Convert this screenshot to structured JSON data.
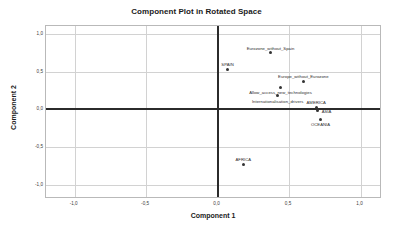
{
  "chart_data": {
    "type": "scatter",
    "title": "Component Plot in Rotated Space",
    "xlabel": "Component 1",
    "ylabel": "Component 2",
    "xlim": [
      -1.2,
      1.15
    ],
    "ylim": [
      -1.18,
      1.1
    ],
    "grid": true,
    "legend": "none",
    "decimal_separator": ",",
    "xticks": [
      {
        "value": -1.0,
        "label": "-1,0"
      },
      {
        "value": -0.5,
        "label": "-0,5"
      },
      {
        "value": 0.0,
        "label": "0,0"
      },
      {
        "value": 0.5,
        "label": "0,5"
      },
      {
        "value": 1.0,
        "label": "1,0"
      }
    ],
    "yticks": [
      {
        "value": 1.0,
        "label": "1,0"
      },
      {
        "value": 0.5,
        "label": "0,5"
      },
      {
        "value": 0.0,
        "label": "0,0"
      },
      {
        "value": -0.5,
        "label": "-0,5"
      },
      {
        "value": -1.0,
        "label": "-1,0"
      }
    ],
    "reference_lines": [
      {
        "axis": "x",
        "value": 0.0
      },
      {
        "axis": "y",
        "value": 0.0
      }
    ],
    "points": [
      {
        "label": "Eurozone_without_Spain",
        "x": 0.37,
        "y": 0.75,
        "label_pos": "above"
      },
      {
        "label": "SPAIN",
        "x": 0.07,
        "y": 0.53,
        "label_pos": "above"
      },
      {
        "label": "Europe_without_Eurozone",
        "x": 0.6,
        "y": 0.37,
        "label_pos": "above"
      },
      {
        "label": "Allow_access_new_technologies",
        "x": 0.44,
        "y": 0.29,
        "label_pos": "below"
      },
      {
        "label": "Internationalisation_drivers",
        "x": 0.42,
        "y": 0.18,
        "label_pos": "below"
      },
      {
        "label": "AMERICA",
        "x": 0.69,
        "y": 0.03,
        "label_pos": "above"
      },
      {
        "label": "ASIA",
        "x": 0.7,
        "y": -0.02,
        "label_pos": "right"
      },
      {
        "label": "OCEANIA",
        "x": 0.72,
        "y": -0.13,
        "label_pos": "below"
      },
      {
        "label": "AFRICA",
        "x": 0.18,
        "y": -0.72,
        "label_pos": "above"
      }
    ],
    "colors": {
      "marker": "#333333",
      "gridline": "#d2d2d2",
      "reference_line": "#2b2b2b",
      "frame": "#b9b9b9",
      "background": "#ffffff",
      "text": "#1a1a1a"
    }
  }
}
